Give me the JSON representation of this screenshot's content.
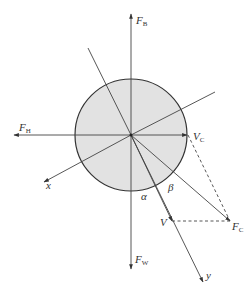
{
  "diagram": {
    "colors": {
      "background": "#ffffff",
      "circle_fill": "#e2e2e2",
      "stroke": "#333333",
      "label": "#333333"
    },
    "circle": {
      "cx": 131,
      "cy": 135,
      "r": 56
    },
    "labels": {
      "F_B": {
        "main": "F",
        "sub": "B"
      },
      "F_H": {
        "main": "F",
        "sub": "H"
      },
      "V_C": {
        "main": "V",
        "sub": "C"
      },
      "F_C": {
        "main": "F",
        "sub": "C"
      },
      "F_W": {
        "main": "F",
        "sub": "W"
      },
      "V": {
        "main": "V"
      },
      "x": {
        "main": "x"
      },
      "y": {
        "main": "y"
      },
      "alpha": {
        "main": "α"
      },
      "beta": {
        "main": "β"
      }
    }
  }
}
